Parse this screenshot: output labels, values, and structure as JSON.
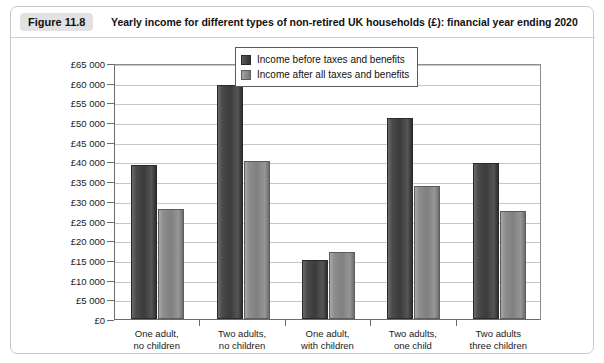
{
  "figure": {
    "badge": "Figure 11.8",
    "title": "Yearly income for different types of non-retired UK households (£): financial year ending 2020"
  },
  "chart_data": {
    "type": "bar",
    "title": "Yearly income for different types of non-retired UK households (£): financial year ending 2020",
    "xlabel": "",
    "ylabel": "",
    "ylim": [
      0,
      65000
    ],
    "ytick_step": 5000,
    "grid": true,
    "legend_position": "top-right",
    "categories": [
      "One adult,\nno children",
      "Two adults,\nno children",
      "One adult,\nwith children",
      "Two adults,\none child",
      "Two adults\nthree children"
    ],
    "category_lines": [
      [
        "One adult,",
        "no children"
      ],
      [
        "Two adults,",
        "no children"
      ],
      [
        "One adult,",
        "with children"
      ],
      [
        "Two adults,",
        "one child"
      ],
      [
        "Two adults",
        "three children"
      ]
    ],
    "ytick_labels": [
      "£0",
      "£5 000",
      "£10 000",
      "£15 000",
      "£20 000",
      "£25 000",
      "£30 000",
      "£35 000",
      "£40 000",
      "£45 000",
      "£50 000",
      "£55 000",
      "£60 000",
      "£65 000"
    ],
    "ytick_values": [
      0,
      5000,
      10000,
      15000,
      20000,
      25000,
      30000,
      35000,
      40000,
      45000,
      50000,
      55000,
      60000,
      65000
    ],
    "series": [
      {
        "name": "Income before taxes and benefits",
        "color": "#3b3b3b",
        "values": [
          39000,
          59300,
          14900,
          51000,
          39500
        ]
      },
      {
        "name": "Income after all taxes and benefits",
        "color": "#8d8d8d",
        "values": [
          28000,
          40000,
          17000,
          33800,
          27500
        ]
      }
    ]
  }
}
